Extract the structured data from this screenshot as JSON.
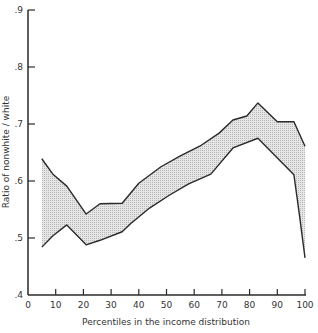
{
  "chart_data": {
    "type": "area",
    "title": "",
    "xlabel": "Percentiles in the income distribution",
    "ylabel": "Ratio of nonwhite / white",
    "xlim": [
      0,
      100
    ],
    "ylim": [
      0.4,
      0.9
    ],
    "x_ticks": [
      0,
      10,
      20,
      30,
      40,
      50,
      60,
      70,
      80,
      90,
      100
    ],
    "y_ticks": [
      0.4,
      0.5,
      0.6,
      0.7,
      0.8,
      0.9
    ],
    "x_tick_labels": [
      "0",
      "10",
      "20",
      "30",
      "40",
      "50",
      "60",
      "70",
      "80",
      "90",
      "100"
    ],
    "y_tick_labels": [
      ".4",
      ".5",
      ".6",
      ".7",
      ".8",
      ".9"
    ],
    "grid": false,
    "legend": null,
    "series": [
      {
        "name": "upper bound",
        "x": [
          5,
          6,
          9,
          14,
          21,
          26,
          34,
          40,
          48,
          55,
          62,
          69,
          74,
          79,
          83,
          90,
          96,
          100
        ],
        "values": [
          0.639,
          0.632,
          0.612,
          0.591,
          0.542,
          0.56,
          0.561,
          0.596,
          0.625,
          0.644,
          0.661,
          0.684,
          0.707,
          0.714,
          0.737,
          0.704,
          0.704,
          0.661
        ]
      },
      {
        "name": "lower bound",
        "x": [
          5,
          9,
          14,
          21,
          26,
          34,
          37,
          44,
          51,
          58,
          66,
          74,
          83,
          96,
          98,
          100
        ],
        "values": [
          0.484,
          0.504,
          0.523,
          0.488,
          0.496,
          0.511,
          0.525,
          0.553,
          0.575,
          0.595,
          0.612,
          0.658,
          0.675,
          0.611,
          0.54,
          0.465
        ]
      }
    ],
    "fill": "shaded band between upper and lower bounds",
    "colors": {
      "line": "#2a2a2a",
      "fill": "#d4d4d4",
      "axis": "#2a2a2a"
    }
  }
}
